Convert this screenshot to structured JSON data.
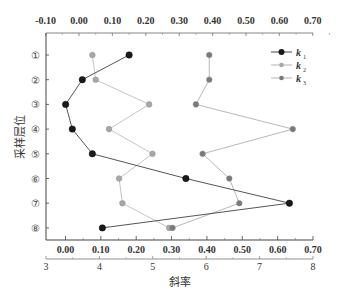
{
  "chart_data": {
    "type": "line",
    "orientation": "horizontal-profile",
    "title": "",
    "xlabel": "斜率",
    "ylabel": "采样层位",
    "top_axis": {
      "range": [
        -0.1,
        0.7
      ],
      "ticks": [
        "-0.10",
        "0.00",
        "0.10",
        "0.20",
        "0.30",
        "0.40",
        "0.50",
        "0.60",
        "0.70"
      ]
    },
    "bottom_axis_inner": {
      "ticks": [
        "0.00",
        "0.10",
        "0.20",
        "0.30",
        "0.40",
        "0.50",
        "0.60",
        "0.70"
      ]
    },
    "bottom_axis_outer": {
      "range": [
        3,
        8
      ],
      "ticks": [
        "3",
        "4",
        "5",
        "6",
        "7",
        "8"
      ]
    },
    "categories": [
      "①",
      "②",
      "③",
      "④",
      "⑤",
      "⑥",
      "⑦",
      "⑧"
    ],
    "series": [
      {
        "name": "k1",
        "label": "k",
        "sub": "1",
        "color": "#1a1a1a",
        "line_color": "#555555",
        "values": [
          0.15,
          0.01,
          -0.04,
          -0.02,
          0.04,
          0.32,
          0.63,
          0.07
        ]
      },
      {
        "name": "k2",
        "label": "k",
        "sub": "2",
        "color": "#a8a8a8",
        "line_color": "#bdbdbd",
        "values": [
          0.04,
          0.05,
          0.21,
          0.09,
          0.22,
          0.12,
          0.13,
          0.27
        ]
      },
      {
        "name": "k3",
        "label": "k",
        "sub": "3",
        "color": "#7a7a7a",
        "line_color": "#b0b0b0",
        "values": [
          0.39,
          0.39,
          0.35,
          0.64,
          0.37,
          0.45,
          0.48,
          0.28
        ]
      }
    ],
    "legend_position": "upper-right",
    "grid": false
  }
}
